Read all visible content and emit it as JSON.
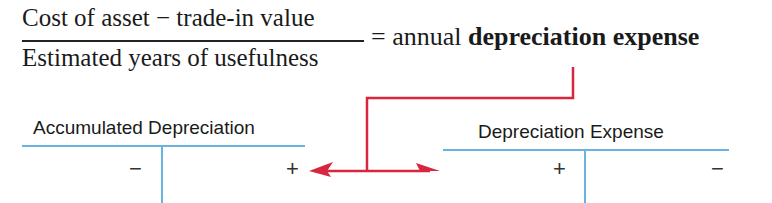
{
  "formula": {
    "numerator": "Cost of asset − trade-in value",
    "denominator": "Estimated years of usefulness",
    "equals": "=",
    "result_prefix": "annual",
    "result_bold": "depreciation expense"
  },
  "accounts": [
    {
      "title": "Accumulated Depreciation",
      "debit_sign": "−",
      "credit_sign": "+"
    },
    {
      "title": "Depreciation Expense",
      "debit_sign": "+",
      "credit_sign": "−"
    }
  ],
  "colors": {
    "arrow": "#d7263d",
    "t_account_lines": "#6ab2e0",
    "text": "#1a1a1a"
  }
}
